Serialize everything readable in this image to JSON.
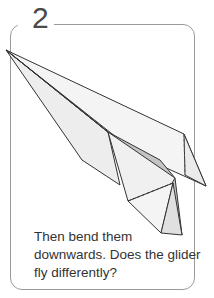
{
  "card": {
    "step_number": "2",
    "caption": "Then bend them downwards. Does the glider fly differently?",
    "illustration": "paper-glider-with-bent-wing-tips"
  },
  "colors": {
    "border": "#9a9a9a",
    "paper_light": "#f2f2f2",
    "paper_mid": "#e4e4e4",
    "paper_dark": "#b8b8b8",
    "outline": "#333333",
    "text": "#333333"
  }
}
